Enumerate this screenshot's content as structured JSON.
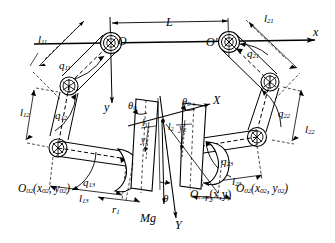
{
  "figure": {
    "type": "kinematic-diagram",
    "background_color": "#ffffff",
    "line_color": "#000000"
  },
  "world_frame": {
    "origin_label": "O",
    "x_axis_label": "x",
    "y_axis_label": "y",
    "span_label": "L"
  },
  "body_frame": {
    "origin_label": "O",
    "origin_sub": "c.m.",
    "origin_args": "(x,y)",
    "x_axis_label": "X",
    "y_axis_label": "Y",
    "tilt_label": "θ",
    "weight_label": "Mg"
  },
  "hips": {
    "left_label": "O",
    "right_label": "O",
    "right_prime": "′"
  },
  "left_leg": {
    "links": [
      {
        "name": "l",
        "sub": "11"
      },
      {
        "name": "l",
        "sub": "12"
      },
      {
        "name": "l",
        "sub": "13"
      }
    ],
    "joints": [
      {
        "name": "q",
        "sub": "11"
      },
      {
        "name": "q",
        "sub": "12"
      },
      {
        "name": "q",
        "sub": "13"
      }
    ],
    "foot_radius": {
      "name": "r",
      "sub": "1"
    },
    "contact_frame": {
      "name": "O",
      "sub": "02",
      "args": "(x",
      "args_sub1": "02",
      "args_mid": ", y",
      "args_sub2": "02",
      "args_end": ")"
    },
    "foot_offset": {
      "name": "l",
      "sub": "1"
    },
    "foot_height": {
      "name": "y",
      "sub": "1"
    },
    "foot_tilt": {
      "name": "θ",
      "sub": "0"
    }
  },
  "right_leg": {
    "links": [
      {
        "name": "l",
        "sub": "21"
      },
      {
        "name": "l",
        "sub": "22"
      },
      {
        "name": "l",
        "sub": "23"
      }
    ],
    "joints": [
      {
        "name": "q",
        "sub": "21"
      },
      {
        "name": "q",
        "sub": "22"
      },
      {
        "name": "q",
        "sub": "23"
      }
    ],
    "foot_radius": {
      "name": "r",
      "sub": "2"
    },
    "contact_frame": {
      "name": "O",
      "sub": "02",
      "args": "(x",
      "args_sub1": "02",
      "args_mid": ", y",
      "args_sub2": "02",
      "args_end": ")"
    },
    "foot_offset": {
      "name": "l",
      "sub": "2"
    },
    "foot_height": {
      "name": "y",
      "sub": "2"
    },
    "foot_tilt": {
      "name": "θ",
      "sub": "0"
    }
  },
  "labels": {
    "l11": "l",
    "l11s": "11",
    "l12": "l",
    "l12s": "12",
    "l13": "l",
    "l13s": "13",
    "l21": "l",
    "l21s": "21",
    "l22": "l",
    "l22s": "22",
    "l23": "l",
    "l23s": "23",
    "q11": "q",
    "q11s": "11",
    "q12": "q",
    "q12s": "12",
    "q13": "q",
    "q13s": "13",
    "q21": "q",
    "q21s": "21",
    "q22": "q",
    "q22s": "22",
    "q23": "q",
    "q23s": "23",
    "r1": "r",
    "r1s": "1",
    "r2": "r",
    "r2s": "2",
    "l1": "l",
    "l1s": "1",
    "l2": "l",
    "l2s": "2",
    "y1": "y",
    "y1s": "1",
    "y2": "y",
    "y2s": "2",
    "theta0a": "θ",
    "theta0as": "0",
    "theta0b": "θ",
    "theta0bs": "0",
    "theta": "θ",
    "Mg": "Mg",
    "L": "L",
    "x_small": "x",
    "y_small": "y",
    "X_big": "X",
    "Y_big": "Y",
    "O_hip_left": "O",
    "O_hip_right": "O′",
    "O02_left_name": "O",
    "O02_left_sub": "02",
    "O02_left_open": "(x",
    "O02_left_s1": "02",
    "O02_left_comma": ", y",
    "O02_left_s2": "02",
    "O02_left_close": ")",
    "O02_right_name": "O",
    "O02_right_sub": "02",
    "O02_right_open": "(x",
    "O02_right_s1": "02",
    "O02_right_comma": ", y",
    "O02_right_s2": "02",
    "O02_right_close": ")",
    "Ocm_name": "O",
    "Ocm_sub": "c.m.",
    "Ocm_args": "(x,y)"
  }
}
